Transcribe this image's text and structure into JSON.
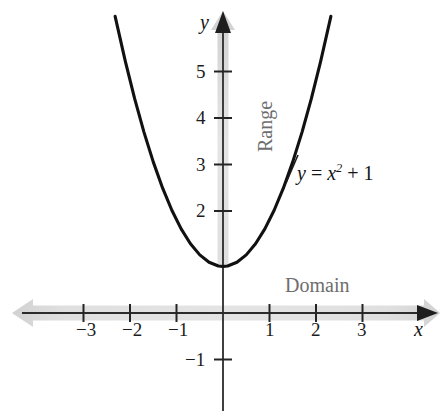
{
  "chart_data": {
    "type": "line",
    "title": "",
    "subtitle": "",
    "function": "y = x^2 + 1",
    "equation_display": "y = x² + 1",
    "xlabel": "x",
    "ylabel": "y",
    "xlim": [
      -3.9,
      4.3
    ],
    "ylim": [
      -1.9,
      6.5
    ],
    "x_ticks": [
      -3,
      -2,
      -1,
      1,
      2,
      3
    ],
    "x_tick_labels": [
      "−3",
      "−2",
      "−1",
      "1",
      "2",
      "3"
    ],
    "y_ticks": [
      -1,
      2,
      3,
      4,
      5
    ],
    "y_tick_labels": [
      "−1",
      "2",
      "3",
      "4",
      "5"
    ],
    "grid": false,
    "legend": "none",
    "curve_x_range": [
      -2.32,
      2.32
    ],
    "vertex": [
      0,
      1
    ],
    "x": [
      -2.32,
      -2.1,
      -1.9,
      -1.7,
      -1.5,
      -1.3,
      -1.1,
      -0.9,
      -0.7,
      -0.5,
      -0.3,
      -0.1,
      0,
      0.1,
      0.3,
      0.5,
      0.7,
      0.9,
      1.1,
      1.3,
      1.5,
      1.7,
      1.9,
      2.1,
      2.32
    ],
    "y": [
      6.38,
      5.41,
      4.61,
      3.89,
      3.25,
      2.69,
      2.21,
      1.81,
      1.49,
      1.25,
      1.09,
      1.01,
      1,
      1.01,
      1.09,
      1.25,
      1.49,
      1.81,
      2.21,
      2.69,
      3.25,
      3.89,
      4.61,
      5.41,
      6.38
    ],
    "annotations": [
      {
        "name": "domain-band",
        "text": "Domain",
        "orientation": "horizontal",
        "arrows": "both",
        "range": "all real numbers"
      },
      {
        "name": "range-band",
        "text": "Range",
        "orientation": "vertical",
        "arrows": "up",
        "range": "y >= 1"
      },
      {
        "name": "equation-label",
        "text": "y = x² + 1"
      }
    ]
  },
  "labels": {
    "axis_x": "x",
    "axis_y": "y",
    "domain": "Domain",
    "range": "Range",
    "equation": {
      "lhs": "y",
      "eq": "=",
      "base": "x",
      "exponent": "2",
      "plus": "+",
      "constant": "1"
    }
  },
  "ticks": {
    "x": [
      {
        "value": -3,
        "label": "−3"
      },
      {
        "value": -2,
        "label": "−2"
      },
      {
        "value": -1,
        "label": "−1"
      },
      {
        "value": 1,
        "label": "1"
      },
      {
        "value": 2,
        "label": "2"
      },
      {
        "value": 3,
        "label": "3"
      }
    ],
    "y": [
      {
        "value": 5,
        "label": "5"
      },
      {
        "value": 4,
        "label": "4"
      },
      {
        "value": 3,
        "label": "3"
      },
      {
        "value": 2,
        "label": "2"
      },
      {
        "value": -1,
        "label": "−1"
      }
    ]
  },
  "colors": {
    "curve": "#111111",
    "axis": "#2b2b2b",
    "band": "#c9c9c9",
    "band_label": "#6e6e6e",
    "tick_text": "#1c1c1c",
    "background": "#ffffff"
  }
}
